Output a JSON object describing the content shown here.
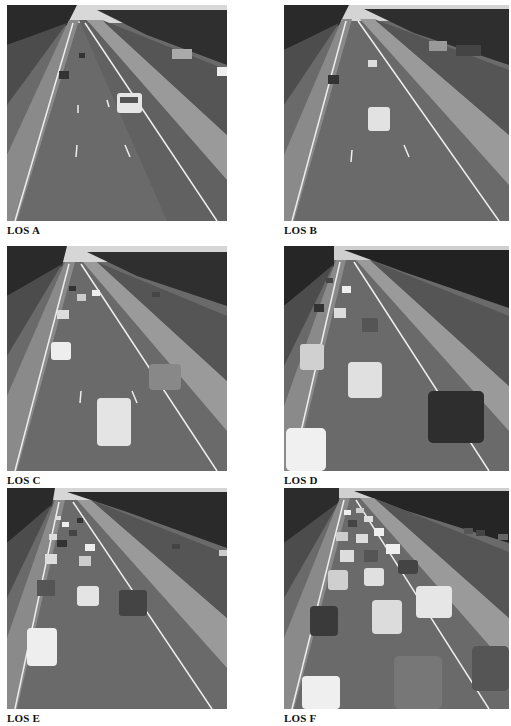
{
  "figure": {
    "panels": [
      {
        "id": "A",
        "label": "LOS A",
        "density": "very light traffic",
        "car_count": 4
      },
      {
        "id": "B",
        "label": "LOS B",
        "density": "light traffic",
        "car_count": 5
      },
      {
        "id": "C",
        "label": "LOS C",
        "density": "moderate traffic",
        "car_count": 9
      },
      {
        "id": "D",
        "label": "LOS D",
        "density": "heavy traffic",
        "car_count": 12
      },
      {
        "id": "E",
        "label": "LOS E",
        "density": "near-capacity traffic",
        "car_count": 16
      },
      {
        "id": "F",
        "label": "LOS F",
        "density": "congested traffic",
        "car_count": 22
      }
    ]
  }
}
